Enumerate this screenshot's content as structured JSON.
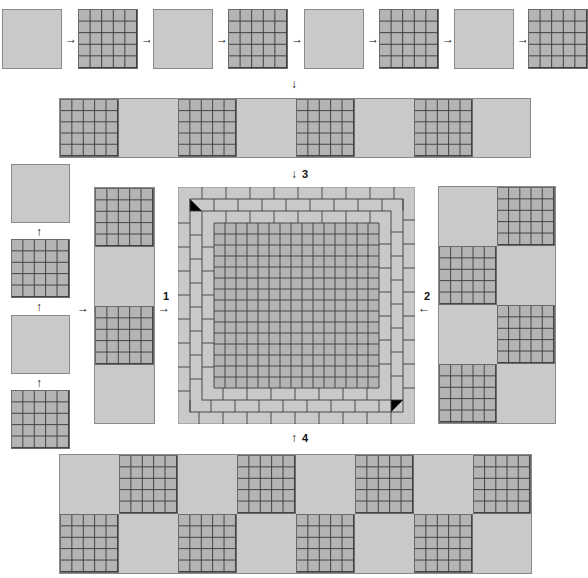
{
  "diagram": {
    "colors": {
      "plain_tile": "#c9c9c9",
      "grid_tile": "#b4b4b4",
      "grid_line": "#3c3c3c",
      "border": "#8a8a8a",
      "background": "#ffffff"
    },
    "top_row": {
      "tiles": [
        "plain",
        "grid",
        "plain",
        "grid",
        "plain",
        "grid",
        "plain",
        "grid"
      ],
      "arrow": "→"
    },
    "horizontal_strip": {
      "tiles": [
        "grid",
        "plain",
        "grid",
        "plain",
        "grid",
        "plain",
        "grid",
        "plain"
      ]
    },
    "left_column": {
      "tiles_top_to_bottom": [
        "plain",
        "grid",
        "plain",
        "grid"
      ],
      "arrow": "↑"
    },
    "vertical_strip": {
      "tiles_top_to_bottom": [
        "grid",
        "plain",
        "grid",
        "plain"
      ]
    },
    "right_block": {
      "rows": [
        [
          "plain",
          "grid"
        ],
        [
          "grid",
          "plain"
        ],
        [
          "plain",
          "grid"
        ],
        [
          "grid",
          "plain"
        ]
      ]
    },
    "bottom_block": {
      "rows": [
        [
          "plain",
          "grid",
          "plain",
          "grid",
          "plain",
          "grid",
          "plain",
          "grid"
        ],
        [
          "grid",
          "plain",
          "grid",
          "plain",
          "grid",
          "plain",
          "grid",
          "plain"
        ]
      ]
    },
    "center": {
      "type": "framed-square",
      "outer_border_courses": 3,
      "inner_grid_cells": 15
    },
    "step_labels": {
      "step1": "1",
      "step2": "2",
      "step3": "3",
      "step4": "4"
    },
    "arrows": {
      "right": "→",
      "left": "←",
      "down": "↓",
      "up": "↑"
    }
  }
}
